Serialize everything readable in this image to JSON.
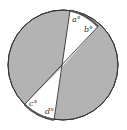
{
  "diagram": {
    "type": "circle-with-intersecting-lines",
    "labels": {
      "a": "a°",
      "b": "b°",
      "c": "c°",
      "d": "d°"
    },
    "colors": {
      "shaded": "#b3b3b3",
      "unshaded": "#ffffff",
      "stroke": "#333333"
    }
  }
}
